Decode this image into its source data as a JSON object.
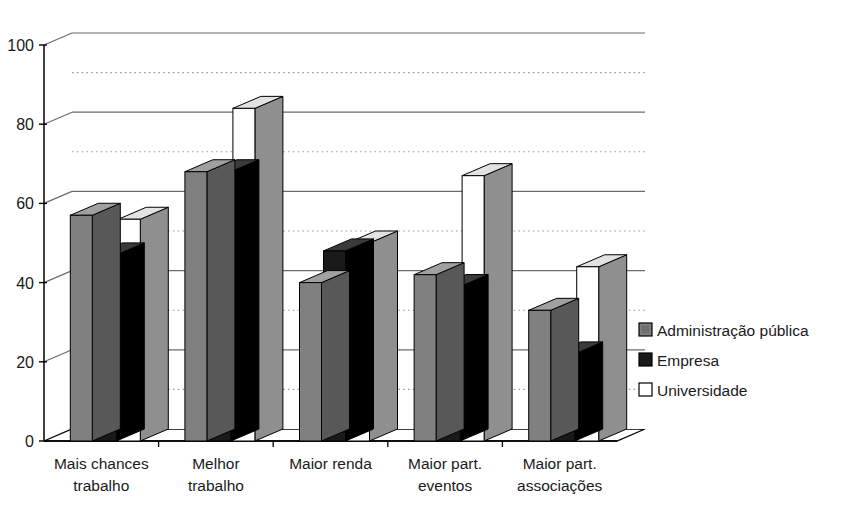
{
  "chart_data": {
    "type": "bar",
    "title": "",
    "subtitle": "",
    "xlabel": "",
    "ylabel": "",
    "ylim": [
      0,
      100
    ],
    "yticks": [
      0,
      20,
      40,
      60,
      80,
      100
    ],
    "ytick_labels": [
      "0",
      "20",
      "40",
      "60",
      "80",
      "100"
    ],
    "minor_gridlines": [
      10,
      30,
      50,
      70,
      90
    ],
    "grid": true,
    "grid_style": "major solid, minor dotted",
    "legend_position": "right",
    "three_d": true,
    "categories": [
      "Mais chances trabalho",
      "Melhor trabalho",
      "Maior renda",
      "Maior part. eventos",
      "Maior part. associações"
    ],
    "category_lines": [
      [
        "Mais chances",
        "trabalho"
      ],
      [
        "Melhor",
        "trabalho"
      ],
      [
        "Maior renda",
        ""
      ],
      [
        "Maior part.",
        "eventos"
      ],
      [
        "Maior part.",
        "associações"
      ]
    ],
    "series": [
      {
        "name": "Administração pública",
        "color": "#808080",
        "values": [
          57,
          68,
          40,
          42,
          33
        ]
      },
      {
        "name": "Empresa",
        "color": "#1a1a1a",
        "values": [
          47,
          68,
          48,
          39,
          22
        ]
      },
      {
        "name": "Universidade",
        "color": "#ffffff",
        "values": [
          56,
          84,
          50,
          67,
          44
        ]
      }
    ]
  },
  "legend": {
    "items": [
      {
        "label": "Administração pública",
        "swatch": "#808080"
      },
      {
        "label": "Empresa",
        "swatch": "#1a1a1a"
      },
      {
        "label": "Universidade",
        "swatch": "#ffffff"
      }
    ]
  },
  "colors": {
    "axis": "#000000",
    "gridline_major": "#6b6b6b",
    "gridline_minor": "#9a9a9a",
    "bar_gray": "#808080",
    "bar_gray_side": "#585858",
    "bar_gray_top": "#a0a0a0",
    "bar_black": "#1a1a1a",
    "bar_black_side": "#000000",
    "bar_black_top": "#3a3a3a",
    "bar_white": "#fbfbfb",
    "bar_white_side": "#8f8f8f",
    "bar_white_top": "#e2e2e2",
    "text": "#1a1a1a",
    "background": "#ffffff"
  }
}
